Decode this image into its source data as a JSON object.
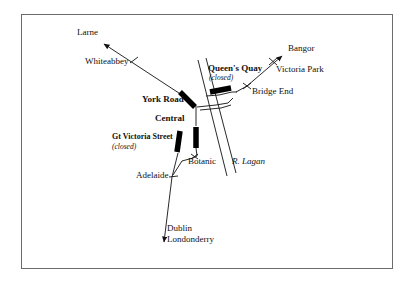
{
  "figure": {
    "kind": "schematic-rail-map",
    "frame": {
      "x": 21,
      "y": 14,
      "width": 372,
      "height": 255,
      "border_color": "#6b6b6b"
    },
    "background_color": "#ffffff",
    "ink_color": "#111111"
  },
  "stations": [
    {
      "id": "york-road",
      "label": "York Road",
      "style": "bold",
      "closed": false,
      "marker": "thick-bar",
      "label_x": 142,
      "label_y": 100,
      "bar": {
        "x1": 180,
        "y1": 92,
        "x2": 194,
        "y2": 106,
        "width": 5
      }
    },
    {
      "id": "central",
      "label": "Central",
      "style": "bold",
      "closed": false,
      "marker": "thick-bar",
      "label_x": 155,
      "label_y": 119,
      "bar": {
        "x1": 196,
        "y1": 127,
        "x2": 196,
        "y2": 147,
        "width": 5
      }
    },
    {
      "id": "gt-victoria-street",
      "label": "Gt Victoria Street",
      "sublabel": "(closed)",
      "style": "bold",
      "closed": true,
      "marker": "thick-bar",
      "label_x": 112,
      "label_y": 138,
      "sublabel_x": 112,
      "sublabel_y": 148,
      "bar": {
        "x1": 180,
        "y1": 131,
        "x2": 177,
        "y2": 152,
        "width": 5
      }
    },
    {
      "id": "queens-quay",
      "label": "Queen's Quay",
      "sublabel": "(closed)",
      "style": "bold",
      "closed": true,
      "marker": "thick-bar",
      "label_x": 208,
      "label_y": 69,
      "sublabel_x": 209,
      "sublabel_y": 79,
      "bar": {
        "x1": 211,
        "y1": 92,
        "x2": 231,
        "y2": 88,
        "width": 5
      }
    },
    {
      "id": "whiteabbey",
      "label": "Whiteabbey",
      "style": "regular",
      "closed": false,
      "marker": "tick",
      "label_x": 85,
      "label_y": 62,
      "tick": {
        "cx": 134,
        "cy": 60,
        "angle": 62
      }
    },
    {
      "id": "victoria-park",
      "label": "Victoria Park",
      "style": "regular",
      "closed": false,
      "marker": "tick",
      "label_x": 276,
      "label_y": 70,
      "tick": {
        "cx": 273,
        "cy": 62,
        "angle": 125
      }
    },
    {
      "id": "bridge-end",
      "label": "Bridge End",
      "style": "regular",
      "closed": false,
      "marker": "tick",
      "label_x": 252,
      "label_y": 92,
      "tick": {
        "cx": 247,
        "cy": 86,
        "angle": 125
      }
    },
    {
      "id": "botanic",
      "label": "Botanic",
      "style": "regular",
      "closed": false,
      "marker": "tick",
      "label_x": 188,
      "label_y": 161,
      "tick": {
        "cx": 194,
        "cy": 157,
        "angle": 20
      }
    },
    {
      "id": "adelaide",
      "label": "Adelaide",
      "style": "regular",
      "closed": false,
      "marker": "tick",
      "label_x": 136,
      "label_y": 175,
      "tick": {
        "cx": 174,
        "cy": 178,
        "angle": 0
      }
    }
  ],
  "destinations": [
    {
      "id": "larne",
      "label": "Larne",
      "label_x": 77,
      "label_y": 33,
      "arrow_to": {
        "x": 102,
        "y": 42
      }
    },
    {
      "id": "bangor",
      "label": "Bangor",
      "label_x": 288,
      "label_y": 49,
      "arrow_to": {
        "x": 284,
        "y": 54
      }
    },
    {
      "id": "dublin",
      "label": "Dublin",
      "label_x": 167,
      "label_y": 228
    },
    {
      "id": "londonderry",
      "label": "Londonderry",
      "label_x": 167,
      "label_y": 239,
      "arrow_to": {
        "x": 163,
        "y": 244
      }
    }
  ],
  "features": [
    {
      "id": "river-lagan",
      "label": "R. Lagan",
      "style": "italic",
      "label_x": 232,
      "label_y": 162
    }
  ],
  "lines": {
    "larne_line": [
      [
        102,
        43
      ],
      [
        188,
        99
      ]
    ],
    "bangor_line": [
      [
        236,
        92
      ],
      [
        247,
        86
      ],
      [
        284,
        55
      ]
    ],
    "queens_quay_spur": [
      [
        205,
        96
      ],
      [
        236,
        92
      ]
    ],
    "central_to_junction": [
      [
        197,
        106
      ],
      [
        199,
        122
      ]
    ],
    "junction_loop": [
      [
        199,
        107
      ],
      [
        228,
        103
      ],
      [
        232,
        97
      ]
    ],
    "botanic_branch": [
      [
        197,
        147
      ],
      [
        196,
        156
      ],
      [
        181,
        162
      ],
      [
        172,
        176
      ]
    ],
    "dublin_line": [
      [
        178,
        152
      ],
      [
        172,
        176
      ],
      [
        163,
        243
      ]
    ],
    "river_left": [
      [
        199,
        60
      ],
      [
        228,
        175
      ]
    ],
    "river_right": [
      [
        207,
        59
      ],
      [
        236,
        173
      ]
    ]
  }
}
